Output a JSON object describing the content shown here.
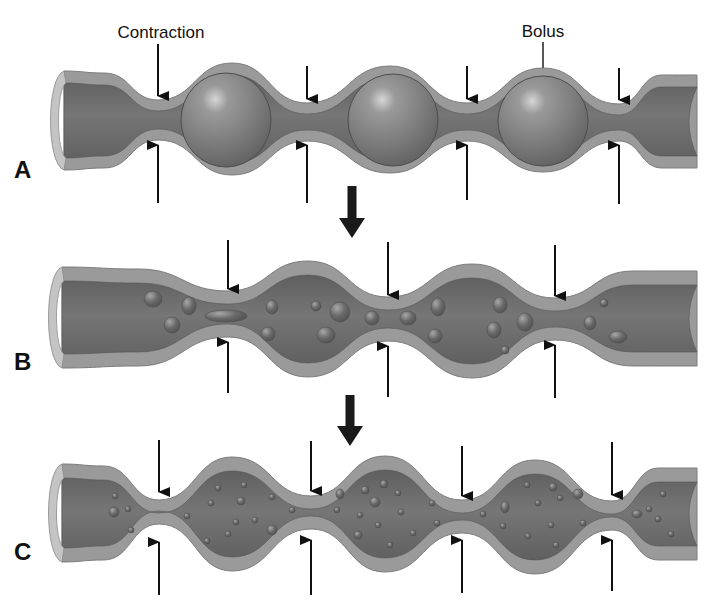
{
  "figure": {
    "colors": {
      "background": "#ffffff",
      "wall": "#9a9a9a",
      "wall_edge": "#7c7c7c",
      "lumen": "#6f6f6f",
      "lumen_dark": "#5c5c5c",
      "end_cap": "#c4c4c4",
      "bolus": "#7a7a7a",
      "bolus_highlight": "#d8d8d8",
      "particle": "#656565",
      "arrow": "#111111",
      "transition_arrow": "#1a1a1a"
    },
    "callouts": [
      {
        "id": "contraction",
        "label": "Contraction",
        "x": 161,
        "y": 38,
        "line_x": 158,
        "line_y1": 44,
        "line_y2": 92,
        "arrowhead": true
      },
      {
        "id": "bolus",
        "label": "Bolus",
        "x": 543,
        "y": 37,
        "line_x": 543,
        "line_y1": 42,
        "line_y2": 124,
        "arrowhead": false
      }
    ],
    "panels": [
      {
        "letter": "A",
        "letter_x": 14,
        "letter_y": 178,
        "x_left": 50,
        "x_right": 697,
        "end_top": 71,
        "end_bottom": 170,
        "lumen_end_top": 83,
        "lumen_end_bottom": 158,
        "constrictions": [
          {
            "x": 158,
            "outer_top": 100,
            "outer_bottom": 140
          },
          {
            "x": 307,
            "outer_top": 103,
            "outer_bottom": 141
          },
          {
            "x": 467,
            "outer_top": 103,
            "outer_bottom": 141
          },
          {
            "x": 619,
            "outer_top": 104,
            "outer_bottom": 141
          }
        ],
        "bulges": [
          {
            "x": 232,
            "outer_top": 63,
            "outer_bottom": 175
          },
          {
            "x": 390,
            "outer_top": 66,
            "outer_bottom": 173
          },
          {
            "x": 543,
            "outer_top": 68,
            "outer_bottom": 172
          }
        ],
        "wall_thickness": 12,
        "arrows_top": [
          {
            "x": 158,
            "y1": 44,
            "y2": 96
          },
          {
            "x": 307,
            "y1": 66,
            "y2": 99
          },
          {
            "x": 467,
            "y1": 66,
            "y2": 99
          },
          {
            "x": 619,
            "y1": 68,
            "y2": 100
          }
        ],
        "arrows_bottom": [
          {
            "x": 158,
            "y1": 203,
            "y2": 145
          },
          {
            "x": 307,
            "y1": 203,
            "y2": 145
          },
          {
            "x": 467,
            "y1": 200,
            "y2": 145
          },
          {
            "x": 619,
            "y1": 204,
            "y2": 145
          }
        ],
        "boluses": [
          {
            "cx": 226,
            "cy": 120,
            "rx": 45,
            "ry": 47
          },
          {
            "cx": 393,
            "cy": 120,
            "rx": 45,
            "ry": 46
          },
          {
            "cx": 543,
            "cy": 121,
            "rx": 45,
            "ry": 45
          }
        ],
        "particles": []
      },
      {
        "letter": "B",
        "letter_x": 14,
        "letter_y": 370,
        "x_left": 48,
        "x_right": 697,
        "end_top": 267,
        "end_bottom": 368,
        "lumen_end_top": 281,
        "lumen_end_bottom": 355,
        "constrictions": [
          {
            "x": 228,
            "outer_top": 291,
            "outer_bottom": 337
          },
          {
            "x": 388,
            "outer_top": 297,
            "outer_bottom": 341
          },
          {
            "x": 555,
            "outer_top": 298,
            "outer_bottom": 340
          }
        ],
        "bulges": [
          {
            "x": 308,
            "outer_top": 261,
            "outer_bottom": 377
          },
          {
            "x": 472,
            "outer_top": 264,
            "outer_bottom": 378
          }
        ],
        "wall_thickness": 14,
        "arrows_top": [
          {
            "x": 228,
            "y1": 240,
            "y2": 289
          },
          {
            "x": 388,
            "y1": 242,
            "y2": 295
          },
          {
            "x": 555,
            "y1": 245,
            "y2": 296
          }
        ],
        "arrows_bottom": [
          {
            "x": 228,
            "y1": 393,
            "y2": 342
          },
          {
            "x": 388,
            "y1": 397,
            "y2": 346
          },
          {
            "x": 555,
            "y1": 398,
            "y2": 345
          }
        ],
        "boluses": [],
        "particles": [
          {
            "cx": 153,
            "cy": 299,
            "rx": 9,
            "ry": 8
          },
          {
            "cx": 189,
            "cy": 306,
            "rx": 7,
            "ry": 9
          },
          {
            "cx": 172,
            "cy": 325,
            "rx": 8,
            "ry": 8
          },
          {
            "cx": 226,
            "cy": 316,
            "rx": 21,
            "ry": 6
          },
          {
            "cx": 272,
            "cy": 307,
            "rx": 6,
            "ry": 7
          },
          {
            "cx": 268,
            "cy": 334,
            "rx": 7,
            "ry": 7
          },
          {
            "cx": 316,
            "cy": 306,
            "rx": 5,
            "ry": 5
          },
          {
            "cx": 340,
            "cy": 312,
            "rx": 10,
            "ry": 10
          },
          {
            "cx": 326,
            "cy": 335,
            "rx": 9,
            "ry": 8
          },
          {
            "cx": 372,
            "cy": 318,
            "rx": 7,
            "ry": 7
          },
          {
            "cx": 408,
            "cy": 318,
            "rx": 8,
            "ry": 7
          },
          {
            "cx": 438,
            "cy": 307,
            "rx": 7,
            "ry": 9
          },
          {
            "cx": 435,
            "cy": 336,
            "rx": 7,
            "ry": 7
          },
          {
            "cx": 500,
            "cy": 305,
            "rx": 7,
            "ry": 8
          },
          {
            "cx": 494,
            "cy": 330,
            "rx": 7,
            "ry": 8
          },
          {
            "cx": 525,
            "cy": 322,
            "rx": 8,
            "ry": 9
          },
          {
            "cx": 505,
            "cy": 350,
            "rx": 4,
            "ry": 4
          },
          {
            "cx": 604,
            "cy": 303,
            "rx": 4,
            "ry": 4
          },
          {
            "cx": 590,
            "cy": 323,
            "rx": 6,
            "ry": 7
          },
          {
            "cx": 618,
            "cy": 337,
            "rx": 9,
            "ry": 6
          }
        ]
      },
      {
        "letter": "C",
        "letter_x": 14,
        "letter_y": 560,
        "x_left": 48,
        "x_right": 697,
        "end_top": 464,
        "end_bottom": 562,
        "lumen_end_top": 476,
        "lumen_end_bottom": 550,
        "constrictions": [
          {
            "x": 159,
            "outer_top": 500,
            "outer_bottom": 524
          },
          {
            "x": 311,
            "outer_top": 496,
            "outer_bottom": 529
          },
          {
            "x": 462,
            "outer_top": 500,
            "outer_bottom": 533
          },
          {
            "x": 612,
            "outer_top": 501,
            "outer_bottom": 530
          }
        ],
        "bulges": [
          {
            "x": 232,
            "outer_top": 457,
            "outer_bottom": 571
          },
          {
            "x": 385,
            "outer_top": 456,
            "outer_bottom": 572
          },
          {
            "x": 535,
            "outer_top": 460,
            "outer_bottom": 574
          }
        ],
        "wall_thickness": 14,
        "arrows_top": [
          {
            "x": 159,
            "y1": 440,
            "y2": 492
          },
          {
            "x": 311,
            "y1": 441,
            "y2": 491
          },
          {
            "x": 462,
            "y1": 446,
            "y2": 496
          },
          {
            "x": 612,
            "y1": 442,
            "y2": 495
          }
        ],
        "arrows_bottom": [
          {
            "x": 159,
            "y1": 595,
            "y2": 542
          },
          {
            "x": 311,
            "y1": 595,
            "y2": 540
          },
          {
            "x": 462,
            "y1": 593,
            "y2": 540
          },
          {
            "x": 612,
            "y1": 591,
            "y2": 540
          }
        ],
        "boluses": [],
        "particles": [
          {
            "cx": 115,
            "cy": 496,
            "rx": 3,
            "ry": 3
          },
          {
            "cx": 114,
            "cy": 512,
            "rx": 5,
            "ry": 5
          },
          {
            "cx": 128,
            "cy": 509,
            "rx": 3,
            "ry": 3
          },
          {
            "cx": 131,
            "cy": 530,
            "rx": 3,
            "ry": 3
          },
          {
            "cx": 187,
            "cy": 516,
            "rx": 3,
            "ry": 3
          },
          {
            "cx": 211,
            "cy": 503,
            "rx": 3,
            "ry": 3
          },
          {
            "cx": 218,
            "cy": 488,
            "rx": 3,
            "ry": 3
          },
          {
            "cx": 244,
            "cy": 485,
            "rx": 3,
            "ry": 3
          },
          {
            "cx": 241,
            "cy": 501,
            "rx": 4,
            "ry": 4
          },
          {
            "cx": 255,
            "cy": 520,
            "rx": 3,
            "ry": 3
          },
          {
            "cx": 228,
            "cy": 534,
            "rx": 3,
            "ry": 3
          },
          {
            "cx": 272,
            "cy": 497,
            "rx": 3,
            "ry": 3
          },
          {
            "cx": 272,
            "cy": 530,
            "rx": 5,
            "ry": 5
          },
          {
            "cx": 236,
            "cy": 522,
            "rx": 3,
            "ry": 3
          },
          {
            "cx": 207,
            "cy": 541,
            "rx": 3,
            "ry": 3
          },
          {
            "cx": 292,
            "cy": 510,
            "rx": 3,
            "ry": 3
          },
          {
            "cx": 337,
            "cy": 510,
            "rx": 3,
            "ry": 3
          },
          {
            "cx": 340,
            "cy": 494,
            "rx": 4,
            "ry": 5
          },
          {
            "cx": 365,
            "cy": 490,
            "rx": 4,
            "ry": 4
          },
          {
            "cx": 375,
            "cy": 502,
            "rx": 5,
            "ry": 5
          },
          {
            "cx": 360,
            "cy": 515,
            "rx": 3,
            "ry": 3
          },
          {
            "cx": 384,
            "cy": 484,
            "rx": 4,
            "ry": 4
          },
          {
            "cx": 398,
            "cy": 493,
            "rx": 3,
            "ry": 3
          },
          {
            "cx": 401,
            "cy": 512,
            "rx": 3,
            "ry": 3
          },
          {
            "cx": 358,
            "cy": 535,
            "rx": 4,
            "ry": 4
          },
          {
            "cx": 378,
            "cy": 525,
            "rx": 3,
            "ry": 3
          },
          {
            "cx": 390,
            "cy": 545,
            "rx": 3,
            "ry": 3
          },
          {
            "cx": 413,
            "cy": 533,
            "rx": 3,
            "ry": 3
          },
          {
            "cx": 432,
            "cy": 503,
            "rx": 3,
            "ry": 3
          },
          {
            "cx": 437,
            "cy": 523,
            "rx": 3,
            "ry": 3
          },
          {
            "cx": 483,
            "cy": 514,
            "rx": 3,
            "ry": 3
          },
          {
            "cx": 505,
            "cy": 507,
            "rx": 4,
            "ry": 6
          },
          {
            "cx": 503,
            "cy": 526,
            "rx": 3,
            "ry": 3
          },
          {
            "cx": 527,
            "cy": 485,
            "rx": 3,
            "ry": 3
          },
          {
            "cx": 538,
            "cy": 503,
            "rx": 3,
            "ry": 3
          },
          {
            "cx": 553,
            "cy": 487,
            "rx": 4,
            "ry": 4
          },
          {
            "cx": 560,
            "cy": 498,
            "rx": 3,
            "ry": 3
          },
          {
            "cx": 578,
            "cy": 494,
            "rx": 5,
            "ry": 5
          },
          {
            "cx": 528,
            "cy": 536,
            "rx": 3,
            "ry": 3
          },
          {
            "cx": 551,
            "cy": 525,
            "rx": 3,
            "ry": 3
          },
          {
            "cx": 556,
            "cy": 545,
            "rx": 3,
            "ry": 3
          },
          {
            "cx": 583,
            "cy": 523,
            "rx": 3,
            "ry": 3
          },
          {
            "cx": 637,
            "cy": 514,
            "rx": 5,
            "ry": 4
          },
          {
            "cx": 649,
            "cy": 509,
            "rx": 3,
            "ry": 3
          },
          {
            "cx": 658,
            "cy": 519,
            "rx": 3,
            "ry": 3
          },
          {
            "cx": 663,
            "cy": 494,
            "rx": 3,
            "ry": 3
          },
          {
            "cx": 671,
            "cy": 534,
            "rx": 3,
            "ry": 3
          }
        ]
      }
    ],
    "transition_arrows": [
      {
        "x": 352,
        "y1": 186,
        "y2": 238
      },
      {
        "x": 350,
        "y1": 395,
        "y2": 446
      }
    ]
  }
}
